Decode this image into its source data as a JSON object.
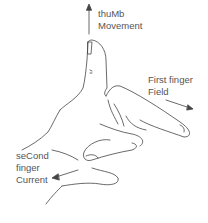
{
  "diagram": {
    "labels": {
      "thumb_line1": "thuMb",
      "thumb_line2": "Movement",
      "first_line1": "First finger",
      "first_line2": "Field",
      "second_line1": "seCond",
      "second_line2": "finger",
      "second_line3": "Current"
    },
    "colors": {
      "stroke": "#444444",
      "text": "#555555"
    }
  }
}
